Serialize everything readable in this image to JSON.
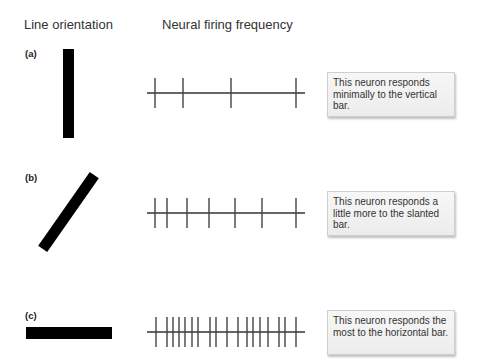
{
  "headers": {
    "line_orientation": "Line orientation",
    "firing_frequency": "Neural firing frequency"
  },
  "rows": [
    {
      "label": "(a)",
      "orientation": "vertical",
      "spike_x": [
        155,
        183,
        231,
        296
      ],
      "caption": "This neuron responds minimally to the vertical bar."
    },
    {
      "label": "(b)",
      "orientation": "slanted",
      "spike_x": [
        155,
        167,
        187,
        209,
        235,
        262,
        296
      ],
      "caption": "This neuron responds a little more to the slanted bar."
    },
    {
      "label": "(c)",
      "orientation": "horizontal",
      "spike_x": [
        156,
        167,
        173,
        179,
        185,
        192,
        198,
        210,
        216,
        227,
        238,
        247,
        253,
        260,
        268,
        279,
        285,
        296
      ],
      "caption": "This neuron responds the most to the horizontal bar."
    }
  ],
  "colors": {
    "bar": "#000000",
    "spike": "#444444",
    "box_border": "#cfcfcf"
  }
}
